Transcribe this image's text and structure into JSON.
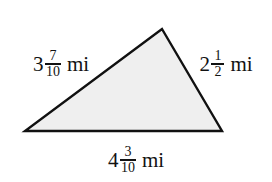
{
  "figure": {
    "type": "triangle-diagram",
    "shape_name": "scalene-triangle",
    "background_color": "#ffffff",
    "fill_color": "#efefef",
    "stroke_color": "#111111",
    "vertices": {
      "apex": [
        162,
        29
      ],
      "bottom_left": [
        25,
        131
      ],
      "bottom_right": [
        222,
        131
      ]
    },
    "unit": "mi",
    "sides": [
      {
        "position": "left",
        "whole": "3",
        "numerator": "7",
        "denominator": "10",
        "unit": "mi",
        "value_text": "3 7/10 mi"
      },
      {
        "position": "right",
        "whole": "2",
        "numerator": "1",
        "denominator": "2",
        "unit": "mi",
        "value_text": "2 1/2 mi"
      },
      {
        "position": "bottom",
        "whole": "4",
        "numerator": "3",
        "denominator": "10",
        "unit": "mi",
        "value_text": "4 3/10 mi"
      }
    ]
  }
}
